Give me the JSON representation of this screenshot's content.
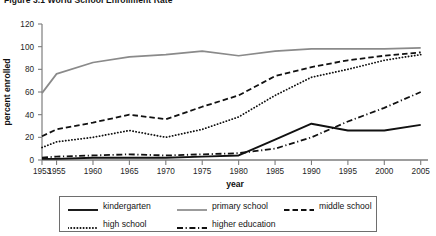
{
  "figure": {
    "title": "Figure 3.1  World School Enrollment Rate"
  },
  "legend": {
    "entries": [
      {
        "label": "kindergarten",
        "style": "solid-thick",
        "color": "#111111"
      },
      {
        "label": "primary school",
        "style": "solid-gray",
        "color": "#8a8a8a"
      },
      {
        "label": "middle school",
        "style": "dashed",
        "color": "#111111"
      },
      {
        "label": "high school",
        "style": "dotted",
        "color": "#111111"
      },
      {
        "label": "higher education",
        "style": "dash-dot",
        "color": "#111111"
      }
    ]
  },
  "chart_data": {
    "type": "line",
    "title": "Figure 3.1  World School Enrollment Rate",
    "xlabel": "year",
    "ylabel": "percent enrolled",
    "xlim": [
      1953,
      2006
    ],
    "ylim": [
      0,
      120
    ],
    "yticks": [
      0,
      20,
      40,
      60,
      80,
      100,
      120
    ],
    "xticks": [
      1953,
      1955,
      1960,
      1965,
      1970,
      1975,
      1980,
      1985,
      1990,
      1995,
      2000,
      2005
    ],
    "grid": false,
    "legend_position": "below-plot",
    "x": [
      1953,
      1955,
      1960,
      1965,
      1970,
      1975,
      1980,
      1985,
      1990,
      1995,
      2000,
      2005
    ],
    "series": [
      {
        "name": "kindergarten",
        "color": "#111111",
        "style": "solid-thick",
        "values": [
          1,
          1,
          2,
          2,
          2,
          3,
          4,
          18,
          32,
          26,
          26,
          31
        ]
      },
      {
        "name": "primary school",
        "color": "#8a8a8a",
        "style": "solid-gray",
        "values": [
          59,
          76,
          86,
          91,
          93,
          96,
          92,
          96,
          98,
          98,
          98,
          99
        ]
      },
      {
        "name": "middle school",
        "color": "#111111",
        "style": "dashed",
        "values": [
          21,
          27,
          33,
          40,
          36,
          47,
          57,
          74,
          82,
          88,
          92,
          95
        ]
      },
      {
        "name": "high school",
        "color": "#111111",
        "style": "dotted",
        "values": [
          11,
          16,
          20,
          26,
          20,
          27,
          38,
          57,
          73,
          80,
          88,
          93
        ]
      },
      {
        "name": "higher education",
        "color": "#111111",
        "style": "dash-dot",
        "values": [
          2,
          3,
          4,
          5,
          4,
          5,
          6,
          10,
          20,
          34,
          46,
          60
        ]
      }
    ]
  }
}
